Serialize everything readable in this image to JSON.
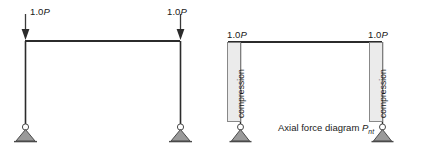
{
  "figures": {
    "frame": {
      "name": "portal-frame-loading-diagram",
      "loads": [
        {
          "label_prefix": "1.0",
          "label_symbol": "P",
          "position": "left",
          "direction": "down"
        },
        {
          "label_prefix": "1.0",
          "label_symbol": "P",
          "position": "right",
          "direction": "down"
        }
      ],
      "supports": [
        {
          "type": "pin",
          "position": "left"
        },
        {
          "type": "pin",
          "position": "right"
        }
      ],
      "members": [
        {
          "type": "beam",
          "position": "top"
        },
        {
          "type": "column",
          "position": "left"
        },
        {
          "type": "column",
          "position": "right"
        }
      ]
    },
    "axial": {
      "name": "axial-force-diagram",
      "caption_text": "Axial force diagram ",
      "caption_symbol": "P",
      "caption_subscript": "nt",
      "loads": [
        {
          "label_prefix": "1.0",
          "label_symbol": "P",
          "position": "left"
        },
        {
          "label_prefix": "1.0",
          "label_symbol": "P",
          "position": "right"
        }
      ],
      "bands": [
        {
          "label": "compression",
          "position": "left"
        },
        {
          "label": "compression",
          "position": "right"
        }
      ],
      "supports": [
        {
          "type": "pin",
          "position": "left"
        },
        {
          "type": "pin",
          "position": "right"
        }
      ]
    }
  },
  "colors": {
    "member_line": "#2b2b2b",
    "band_fill": "#ebebeb",
    "band_stroke": "#7d7d7d",
    "support_fill": "#9a9a9a",
    "support_stroke": "#4a4a4a",
    "background": "#ffffff",
    "text": "#1a1a1a"
  }
}
